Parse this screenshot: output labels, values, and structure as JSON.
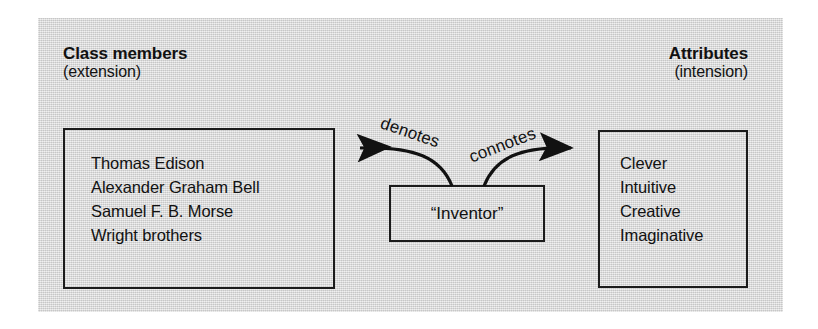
{
  "figure": {
    "panel_color": "#d9d9d9",
    "ink_color": "#111111"
  },
  "left_column": {
    "heading": "Class members",
    "subheading": "(extension)",
    "items": [
      "Thomas Edison",
      "Alexander Graham Bell",
      "Samuel F. B. Morse",
      "Wright brothers"
    ]
  },
  "right_column": {
    "heading": "Attributes",
    "subheading": "(intension)",
    "items": [
      "Clever",
      "Intuitive",
      "Creative",
      "Imaginative"
    ]
  },
  "center": {
    "term": "“Inventor”"
  },
  "arrows": {
    "left_label": "denotes",
    "right_label": "connotes"
  }
}
